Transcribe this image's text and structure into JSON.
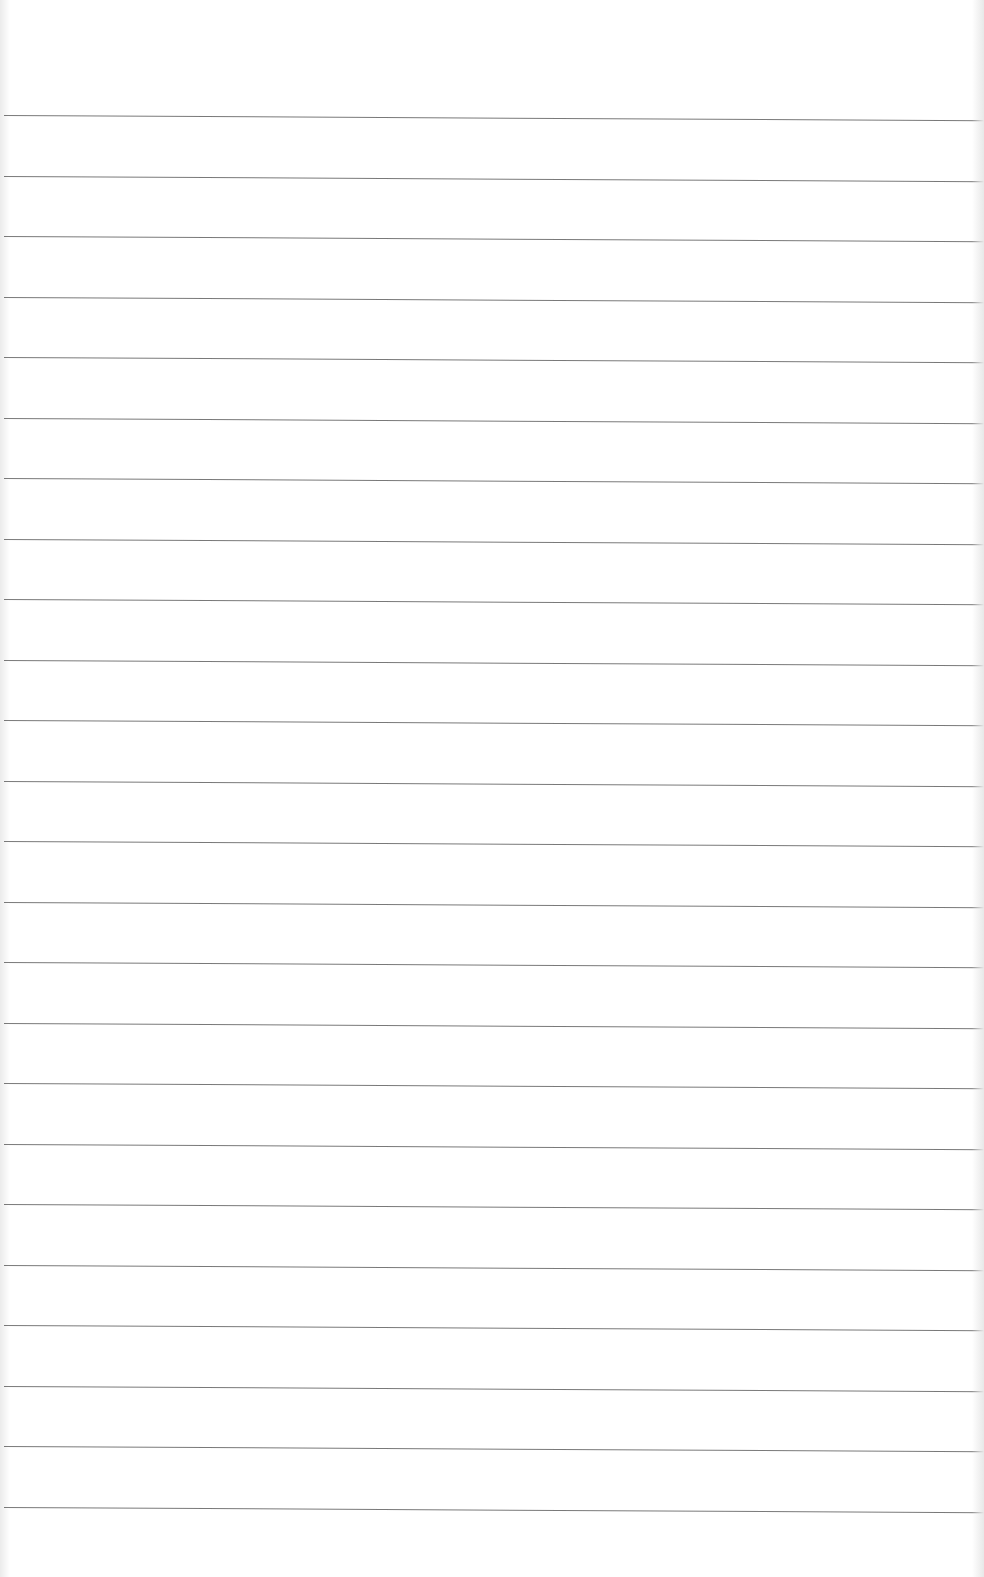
{
  "page": {
    "type": "lined-paper",
    "text_content": "",
    "line_count": 24,
    "first_line_y": 115,
    "line_spacing": 60.5,
    "line_color": "#6a6a6a",
    "paper_color": "#ffffff"
  }
}
